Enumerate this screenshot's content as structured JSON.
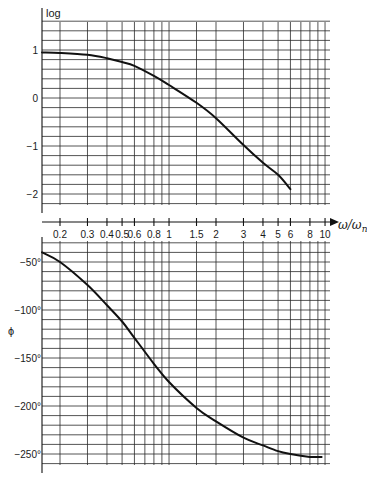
{
  "chart_data": [
    {
      "type": "line",
      "title": "",
      "ylabel": "log",
      "xlabel": "ω/ω_n",
      "xscale": "log",
      "xlim": [
        0.13,
        10
      ],
      "ylim": [
        -2.3,
        1.5
      ],
      "grid": true,
      "x_ticks": [
        0.2,
        0.3,
        0.4,
        0.5,
        0.6,
        0.8,
        1,
        1.5,
        2,
        3,
        4,
        5,
        6,
        8,
        10
      ],
      "x_tick_labels": [
        "0.2",
        "0.3",
        "0.4",
        "0.5",
        "0.6",
        "0.8",
        "1",
        "1.5",
        "2",
        "3",
        "4",
        "5",
        "6",
        "8",
        "10"
      ],
      "y_ticks": [
        1,
        0,
        -1,
        -2
      ],
      "y_tick_labels": [
        "1",
        "0",
        "−1",
        "−2"
      ],
      "series": [
        {
          "name": "log magnitude",
          "x": [
            0.13,
            0.2,
            0.3,
            0.4,
            0.5,
            0.6,
            0.8,
            1,
            1.5,
            2,
            3,
            4,
            5,
            6
          ],
          "y": [
            0.95,
            0.94,
            0.9,
            0.83,
            0.75,
            0.67,
            0.46,
            0.27,
            -0.1,
            -0.42,
            -0.98,
            -1.35,
            -1.6,
            -1.9
          ]
        }
      ]
    },
    {
      "type": "line",
      "title": "",
      "ylabel": "ϕ",
      "xlabel": "ω/ω_n",
      "xscale": "log",
      "xlim": [
        0.13,
        10
      ],
      "ylim": [
        -260,
        -30
      ],
      "grid": true,
      "y_ticks": [
        -50,
        -100,
        -150,
        -200,
        -250
      ],
      "y_tick_labels": [
        "−50°",
        "−100°",
        "−150°",
        "−200°",
        "−250°"
      ],
      "series": [
        {
          "name": "phase",
          "x": [
            0.13,
            0.2,
            0.3,
            0.4,
            0.5,
            0.6,
            0.8,
            1,
            1.5,
            2,
            3,
            4,
            5,
            6,
            8,
            9.5
          ],
          "y": [
            -40,
            -50,
            -74,
            -95,
            -112,
            -129,
            -156,
            -175,
            -202,
            -216,
            -233,
            -241,
            -247,
            -250,
            -253,
            -253
          ]
        }
      ]
    }
  ],
  "figure": {
    "top_ylabel": "log",
    "bottom_ylabel": "ϕ",
    "x_axis_title": "ω/ω",
    "x_axis_title_sub": "n",
    "x_gridlines": [
      0.2,
      0.3,
      0.4,
      0.5,
      0.6,
      0.7,
      0.8,
      0.9,
      1,
      1.5,
      2,
      3,
      4,
      5,
      6,
      7,
      8,
      9,
      10
    ]
  }
}
